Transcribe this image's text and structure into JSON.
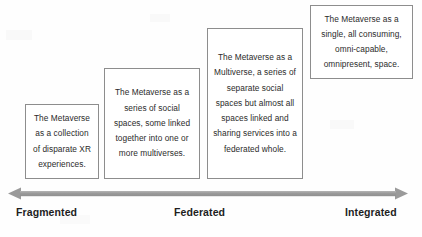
{
  "diagram": {
    "boxes": [
      {
        "id": "fragmented-box",
        "text": "The Metaverse as a collection of disparate XR experiences."
      },
      {
        "id": "linked-spaces-box",
        "text": "The Metaverse as a series of social spaces, some linked together into one or more multiverses."
      },
      {
        "id": "multiverse-box",
        "text": "The Metaverse as a Multiverse, a series of separate social spaces but almost all spaces linked and sharing services into a federated whole."
      },
      {
        "id": "integrated-box",
        "text": "The Metaverse as a single, all consuming, omni-capable, omnipresent, space."
      }
    ],
    "axis": {
      "arrow_name": "double-headed-arrow-icon",
      "arrow_color": "#9a9a9a",
      "labels": [
        {
          "id": "fragmented",
          "text": "Fragmented"
        },
        {
          "id": "federated",
          "text": "Federated"
        },
        {
          "id": "integrated",
          "text": "Integrated"
        }
      ]
    },
    "colors": {
      "box_border": "#8d8d8d",
      "box_text": "#2b2b2b",
      "label_text": "#1e1e1e",
      "background": "#fefefe"
    }
  }
}
